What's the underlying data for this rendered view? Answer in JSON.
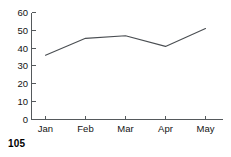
{
  "page": {
    "page_number": "105",
    "background_color": "#ffffff"
  },
  "chart_data": {
    "type": "line",
    "title": "",
    "subtitle": "",
    "xlabel": "",
    "ylabel": "",
    "categories": [
      "Jan",
      "Feb",
      "Mar",
      "Apr",
      "May"
    ],
    "values": [
      36,
      45.5,
      47,
      41,
      51
    ],
    "series": [
      {
        "name": "series-1",
        "values": [
          36,
          45.5,
          47,
          41,
          51
        ],
        "color": "#4a4e52"
      }
    ],
    "ylim": [
      0,
      60
    ],
    "yticks": [
      0,
      10,
      20,
      30,
      40,
      50,
      60
    ],
    "ytick_labels": [
      "0",
      "10",
      "20",
      "30",
      "40",
      "50",
      "60"
    ],
    "xtick_labels": [
      "Jan",
      "Feb",
      "Mar",
      "Apr",
      "May"
    ],
    "grid": false,
    "legend": false,
    "legend_position": "none",
    "axis_color": "#55595c",
    "line_color": "#4a4e52",
    "markers": false
  }
}
